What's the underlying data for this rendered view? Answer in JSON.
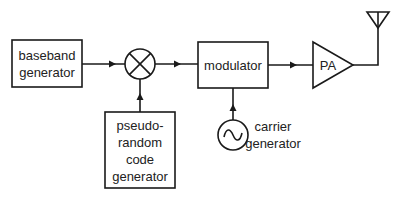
{
  "diagram": {
    "type": "block-diagram",
    "blocks": {
      "baseband": {
        "line1": "baseband",
        "line2": "generator"
      },
      "mixer": {
        "symbol": "multiplier"
      },
      "pn_code": {
        "line1": "pseudo-",
        "line2": "random",
        "line3": "code",
        "line4": "generator"
      },
      "modulator": {
        "label": "modulator"
      },
      "carrier": {
        "line1": "carrier",
        "line2": "generator",
        "symbol": "sine-oscillator"
      },
      "pa": {
        "label": "PA"
      },
      "antenna": {
        "symbol": "antenna"
      }
    },
    "connections": [
      {
        "from": "baseband generator",
        "to": "mixer"
      },
      {
        "from": "pseudo-random code generator",
        "to": "mixer"
      },
      {
        "from": "mixer",
        "to": "modulator"
      },
      {
        "from": "carrier generator",
        "to": "modulator"
      },
      {
        "from": "modulator",
        "to": "PA"
      },
      {
        "from": "PA",
        "to": "antenna"
      }
    ],
    "colors": {
      "line": "#1a1a1a",
      "text": "#222222",
      "background": "#ffffff"
    }
  }
}
